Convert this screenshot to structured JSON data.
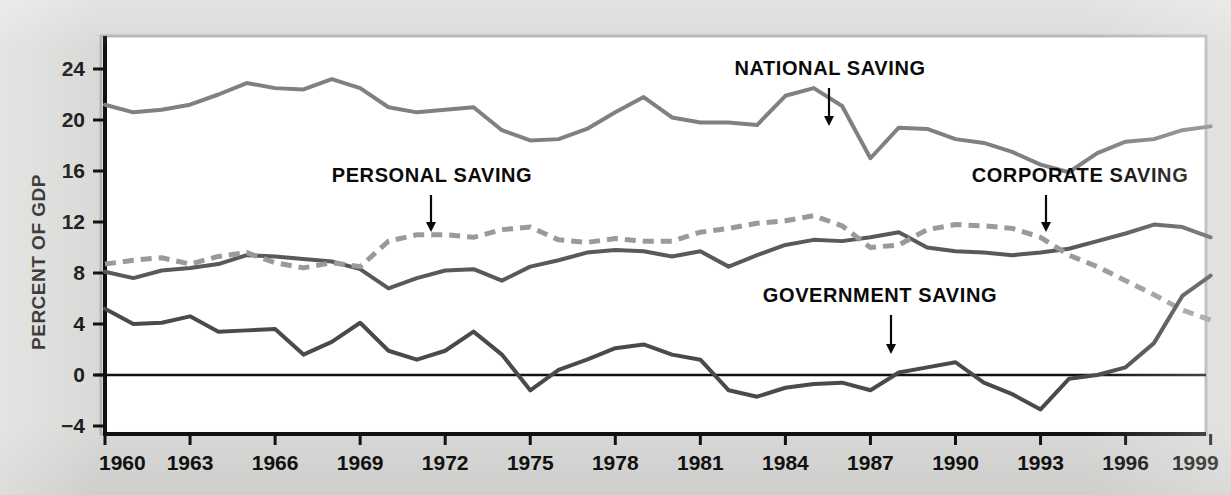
{
  "chart_data": {
    "type": "line",
    "title": "",
    "xlabel": "",
    "ylabel": "PERCENT OF GDP",
    "xlim": [
      1960,
      1999
    ],
    "ylim": [
      -5.5,
      25.6
    ],
    "grid": false,
    "legend_position": "inline-annotations",
    "zero_line": 0,
    "x_ticks": [
      1960,
      1963,
      1966,
      1969,
      1972,
      1975,
      1978,
      1981,
      1984,
      1987,
      1990,
      1993,
      1996,
      1999
    ],
    "x_tick_labels": [
      "1960",
      "1963",
      "1966",
      "1969",
      "1972",
      "1975",
      "1978",
      "1981",
      "1984",
      "1987",
      "1990",
      "1993",
      "1996",
      "1999"
    ],
    "y_ticks": [
      -4,
      0,
      4,
      8,
      12,
      16,
      20,
      24
    ],
    "y_tick_labels": [
      "−4",
      "0",
      "4",
      "8",
      "12",
      "16",
      "20",
      "24"
    ],
    "x": [
      1960,
      1961,
      1962,
      1963,
      1964,
      1965,
      1966,
      1967,
      1968,
      1969,
      1970,
      1971,
      1972,
      1973,
      1974,
      1975,
      1976,
      1977,
      1978,
      1979,
      1980,
      1981,
      1982,
      1983,
      1984,
      1985,
      1986,
      1987,
      1988,
      1989,
      1990,
      1991,
      1992,
      1993,
      1994,
      1995,
      1996,
      1997,
      1998,
      1999
    ],
    "series": [
      {
        "name": "NATIONAL SAVING",
        "style": "solid",
        "color": "#808080",
        "width": 4,
        "values": [
          21.2,
          20.6,
          20.8,
          21.2,
          22.0,
          22.9,
          22.5,
          22.4,
          23.2,
          22.5,
          21.0,
          20.6,
          20.8,
          21.0,
          19.2,
          18.4,
          18.5,
          19.3,
          20.6,
          21.8,
          20.2,
          19.8,
          19.8,
          19.6,
          21.9,
          22.5,
          21.1,
          17.0,
          19.4,
          19.3,
          18.5,
          18.2,
          17.5,
          16.5,
          15.9,
          17.4,
          18.3,
          18.5,
          19.2,
          19.5
        ]
      },
      {
        "name": "CORPORATE SAVING",
        "style": "solid",
        "color": "#595959",
        "width": 4,
        "values": [
          8.1,
          7.6,
          8.2,
          8.4,
          8.7,
          9.4,
          9.3,
          9.1,
          8.9,
          8.3,
          6.8,
          7.6,
          8.2,
          8.3,
          7.4,
          8.5,
          9.0,
          9.6,
          9.8,
          9.7,
          9.3,
          9.7,
          8.5,
          9.4,
          10.2,
          10.6,
          10.5,
          10.8,
          11.2,
          10.0,
          9.7,
          9.6,
          9.4,
          9.6,
          9.9,
          10.5,
          11.1,
          11.8,
          11.6,
          10.8
        ]
      },
      {
        "name": "PERSONAL SAVING",
        "style": "dashed",
        "color": "#9a9a9a",
        "width": 5,
        "values": [
          8.7,
          9.0,
          9.2,
          8.7,
          9.3,
          9.6,
          8.8,
          8.4,
          8.8,
          8.5,
          10.5,
          11.0,
          11.0,
          10.8,
          11.4,
          11.6,
          10.6,
          10.4,
          10.7,
          10.5,
          10.5,
          11.2,
          11.5,
          11.9,
          12.1,
          12.5,
          11.7,
          10.0,
          10.2,
          11.4,
          11.8,
          11.7,
          11.5,
          10.8,
          9.4,
          8.5,
          7.4,
          6.3,
          5.1,
          4.3
        ]
      },
      {
        "name": "GOVERNMENT SAVING",
        "style": "solid",
        "color": "#4a4a4a",
        "width": 4,
        "values": [
          5.2,
          4.0,
          4.1,
          4.6,
          3.4,
          3.5,
          3.6,
          1.6,
          2.6,
          4.1,
          1.9,
          1.2,
          1.9,
          3.4,
          1.6,
          -1.2,
          0.4,
          1.2,
          2.1,
          2.4,
          1.6,
          1.2,
          -1.2,
          -1.7,
          -1.0,
          -0.7,
          -0.6,
          -1.2,
          0.2,
          0.6,
          1.0,
          -0.6,
          -1.5,
          -2.7,
          -0.3,
          0.0,
          0.6,
          2.5,
          6.2,
          7.8
        ]
      }
    ],
    "annotations": [
      {
        "text": "NATIONAL SAVING",
        "label_x": 830,
        "label_y": 75,
        "arrow_x": 829,
        "arrow_top": 88,
        "arrow_bottom": 126
      },
      {
        "text": "PERSONAL SAVING",
        "label_x": 432,
        "label_y": 182,
        "arrow_x": 431,
        "arrow_top": 195,
        "arrow_bottom": 232
      },
      {
        "text": "CORPORATE SAVING",
        "label_x": 1080,
        "label_y": 182,
        "arrow_x": 1046,
        "arrow_top": 195,
        "arrow_bottom": 232
      },
      {
        "text": "GOVERNMENT SAVING",
        "label_x": 880,
        "label_y": 302,
        "arrow_x": 891,
        "arrow_top": 315,
        "arrow_bottom": 354
      }
    ]
  },
  "figure": {
    "plot_background": "#ffffff",
    "page_background": "#d9d9d7",
    "axis_color": "#111111",
    "frame_color": "#b0b0b0"
  }
}
